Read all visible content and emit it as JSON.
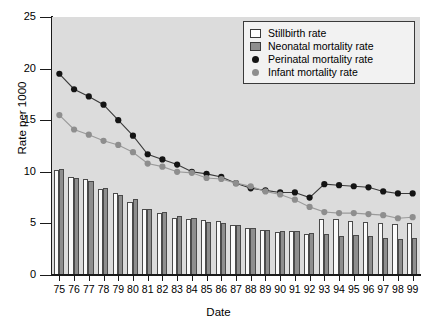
{
  "chart_data": {
    "type": "bar",
    "title": "",
    "xlabel": "Date",
    "ylabel": "Rate per 1000",
    "ylim": [
      0,
      25
    ],
    "yticks": [
      0,
      5,
      10,
      15,
      20,
      25
    ],
    "grid": false,
    "legend_position": "top-right",
    "categories": [
      "75",
      "76",
      "77",
      "78",
      "79",
      "80",
      "81",
      "82",
      "83",
      "84",
      "85",
      "86",
      "87",
      "88",
      "89",
      "90",
      "91",
      "92",
      "93",
      "94",
      "95",
      "96",
      "97",
      "98",
      "99"
    ],
    "series": [
      {
        "name": "Stillbirth rate",
        "type": "bar",
        "color": "#fbfbfb",
        "values": [
          10.2,
          9.5,
          9.3,
          8.3,
          7.9,
          7.1,
          6.4,
          6.0,
          5.5,
          5.4,
          5.3,
          5.2,
          4.8,
          4.6,
          4.4,
          4.2,
          4.3,
          4.0,
          5.4,
          5.4,
          5.2,
          5.1,
          5.0,
          4.9,
          5.0
        ]
      },
      {
        "name": "Neonatal mortality rate",
        "type": "bar",
        "color": "#8e8e8e",
        "values": [
          10.3,
          9.4,
          9.1,
          8.4,
          7.8,
          7.4,
          6.4,
          6.1,
          5.7,
          5.5,
          5.1,
          5.0,
          4.8,
          4.6,
          4.4,
          4.3,
          4.3,
          4.1,
          4.0,
          3.8,
          3.9,
          3.8,
          3.6,
          3.5,
          3.6
        ]
      },
      {
        "name": "Perinatal mortality rate",
        "type": "line",
        "color": "#141414",
        "values": [
          19.5,
          18.0,
          17.3,
          16.5,
          15.0,
          13.5,
          11.7,
          11.2,
          10.7,
          10.0,
          9.8,
          9.5,
          8.9,
          8.4,
          8.2,
          8.0,
          8.0,
          7.5,
          8.8,
          8.7,
          8.6,
          8.5,
          8.1,
          7.9,
          7.9
        ]
      },
      {
        "name": "Infant mortality rate",
        "type": "line",
        "color": "#8e8e8e",
        "values": [
          15.5,
          14.1,
          13.6,
          13.0,
          12.6,
          11.9,
          10.8,
          10.5,
          10.0,
          9.9,
          9.4,
          9.3,
          8.9,
          8.6,
          8.1,
          7.8,
          7.3,
          6.6,
          6.1,
          6.0,
          6.0,
          5.9,
          5.8,
          5.5,
          5.6
        ]
      }
    ]
  },
  "legend": {
    "items": [
      {
        "label": "Stillbirth rate",
        "marker": "white-rect-swatch"
      },
      {
        "label": "Neonatal mortality rate",
        "marker": "gray-rect-swatch"
      },
      {
        "label": "Perinatal mortality rate",
        "marker": "black-dot-marker"
      },
      {
        "label": "Infant mortality rate",
        "marker": "gray-dot-marker"
      }
    ]
  },
  "axes": {
    "y_title": "Rate per 1000",
    "x_title": "Date",
    "y_tick_labels": [
      "0",
      "5",
      "10",
      "15",
      "20",
      "25"
    ],
    "x_tick_labels": [
      "75",
      "76",
      "77",
      "78",
      "79",
      "80",
      "81",
      "82",
      "83",
      "84",
      "85",
      "86",
      "87",
      "88",
      "89",
      "90",
      "91",
      "92",
      "93",
      "94",
      "95",
      "96",
      "97",
      "98",
      "99"
    ]
  },
  "colors": {
    "plot_background": "#dcdcdc",
    "axis": "#1a1a1a",
    "stillbirth_bar": "#fbfbfb",
    "neonatal_bar": "#8e8e8e",
    "perinatal_line": "#141414",
    "infant_line": "#8e8e8e"
  }
}
